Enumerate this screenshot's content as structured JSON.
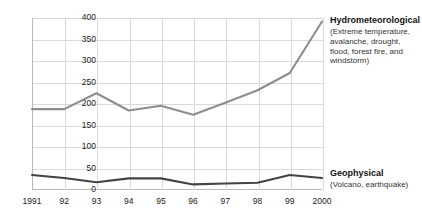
{
  "chart_data": {
    "type": "line",
    "title": "",
    "xlabel": "",
    "ylabel": "",
    "ylim": [
      0,
      400
    ],
    "ytick_values": [
      0,
      50,
      100,
      150,
      200,
      250,
      300,
      350,
      400
    ],
    "ytick_labels": [
      "0",
      "50",
      "100",
      "150",
      "200",
      "250",
      "300",
      "350",
      "400"
    ],
    "grid": true,
    "legend_position": "right-inline-labels",
    "categories": [
      "1991",
      "92",
      "93",
      "94",
      "95",
      "96",
      "97",
      "98",
      "99",
      "2000"
    ],
    "x": [
      1991,
      1992,
      1993,
      1994,
      1995,
      1996,
      1997,
      1998,
      1999,
      2000
    ],
    "series": [
      {
        "name": "Hydrometeorological",
        "description": "(Extreme temperature, avalanche, drought, flood, forest fire, and windstorm)",
        "color": "#8d8d8d",
        "values": [
          188,
          188,
          225,
          185,
          196,
          175,
          203,
          232,
          272,
          392
        ]
      },
      {
        "name": "Geophysical",
        "description": "(Volcano, earthquake)",
        "color": "#434343",
        "values": [
          35,
          28,
          18,
          27,
          27,
          13,
          15,
          17,
          35,
          28
        ]
      }
    ]
  },
  "labels": {
    "hydro_title": "Hydrometeorological",
    "hydro_desc": "(Extreme temperature, avalanche, drought, flood, forest fire, and windstorm)",
    "geo_title": "Geophysical",
    "geo_desc": "(Volcano, earthquake)"
  }
}
